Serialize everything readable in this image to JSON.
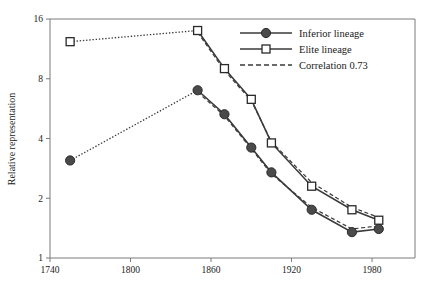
{
  "chart_data": {
    "type": "line",
    "title": "",
    "xlabel": "",
    "ylabel": "Relative representation",
    "xlim": [
      1740,
      2012
    ],
    "ylim": [
      1,
      16
    ],
    "yscale": "log2",
    "grid": false,
    "legend_position": "top-right",
    "xticks": [
      1740,
      1800,
      1860,
      1920,
      1980
    ],
    "xtick_labels": [
      "1740",
      "1800",
      "1860",
      "1920",
      "1980"
    ],
    "yticks": [
      1,
      2,
      4,
      8,
      16
    ],
    "ytick_labels": [
      "1",
      "2",
      "4",
      "8",
      "16"
    ],
    "series": [
      {
        "name": "Inferior lineage",
        "marker": "filled-circle",
        "linestyle": "solid",
        "color": "#3a3a3a",
        "x": [
          1755,
          1850,
          1870,
          1890,
          1905,
          1935,
          1965,
          1985
        ],
        "values": [
          3.1,
          7.0,
          5.3,
          3.6,
          2.7,
          1.75,
          1.35,
          1.4
        ]
      },
      {
        "name": "Elite lineage",
        "marker": "open-square",
        "linestyle": "solid",
        "color": "#3a3a3a",
        "x": [
          1755,
          1850,
          1870,
          1890,
          1905,
          1935,
          1965,
          1985
        ],
        "values": [
          12.3,
          14.0,
          9.0,
          6.3,
          3.8,
          2.3,
          1.75,
          1.55
        ]
      },
      {
        "name": "Correlation 0.73",
        "marker": "none",
        "linestyle": "dashed",
        "color": "#3a3a3a",
        "x": [
          1850,
          1870,
          1890,
          1905,
          1935,
          1965,
          1985
        ],
        "values_elite": [
          13.7,
          8.8,
          6.2,
          3.85,
          2.4,
          1.8,
          1.6
        ],
        "values_inferior": [
          6.85,
          5.2,
          3.55,
          2.65,
          1.8,
          1.4,
          1.45
        ]
      }
    ],
    "legend": [
      {
        "label": "Inferior lineage",
        "marker": "filled-circle",
        "linestyle": "solid"
      },
      {
        "label": "Elite lineage",
        "marker": "open-square",
        "linestyle": "solid"
      },
      {
        "label": "Correlation 0.73",
        "marker": "none",
        "linestyle": "dashed"
      }
    ],
    "colors": {
      "line": "#3a3a3a",
      "marker_fill": "#4a4a4a",
      "marker_edge": "#2a2a2a",
      "axis": "#7a7a7a",
      "background": "#ffffff"
    }
  }
}
